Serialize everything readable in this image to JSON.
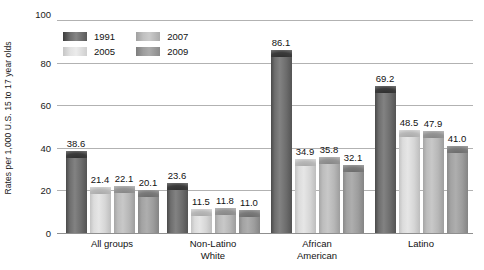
{
  "chart_data": {
    "type": "bar",
    "title": "",
    "subtitle": "",
    "xlabel": "",
    "ylabel": "Rates per 1,000 U.S. 15 to 17 year olds",
    "ylim": [
      0,
      100
    ],
    "yticks": [
      0,
      20,
      40,
      60,
      80,
      100
    ],
    "grid": true,
    "legend_position": "top-left-inside",
    "categories": [
      "All groups",
      "Non-Latino\nWhite",
      "African\nAmerican",
      "Latino"
    ],
    "series": [
      {
        "name": "1991",
        "values": [
          38.6,
          23.6,
          86.1,
          69.2
        ],
        "color": "#6e6e6e"
      },
      {
        "name": "2005",
        "values": [
          21.4,
          11.5,
          34.9,
          48.5
        ],
        "color": "#e2e2e2"
      },
      {
        "name": "2007",
        "values": [
          22.1,
          11.8,
          35.8,
          47.9
        ],
        "color": "#c0c0c0"
      },
      {
        "name": "2009",
        "values": [
          20.1,
          11.0,
          32.1,
          41.0
        ],
        "color": "#9e9e9e"
      }
    ],
    "data_labels": [
      [
        "38.6",
        "21.4",
        "22.1",
        "20.1"
      ],
      [
        "23.6",
        "11.5",
        "11.8",
        "11.0"
      ],
      [
        "86.1",
        "34.9",
        "35.8",
        "32.1"
      ],
      [
        "69.2",
        "48.5",
        "47.9",
        "41.0"
      ]
    ],
    "ytick_labels": [
      "0",
      "20",
      "40",
      "60",
      "80",
      "100"
    ]
  }
}
